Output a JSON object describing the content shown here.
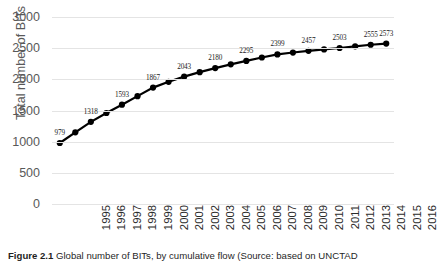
{
  "figure": {
    "caption_bold": "Figure 2.1",
    "caption_rest": " Global number of BITs, by cumulative flow (Source: based on UNCTAD"
  },
  "chart_data": {
    "type": "line",
    "title": "",
    "xlabel": "",
    "ylabel": "Total number of BITs",
    "ylim": [
      0,
      3000
    ],
    "yticks": [
      "0",
      "500",
      "1000",
      "1500",
      "2000",
      "2500",
      "3000"
    ],
    "ytick_values": [
      0,
      500,
      1000,
      1500,
      2000,
      2500,
      3000
    ],
    "grid": "horizontal",
    "legend": "none",
    "marker": "circle-filled-black",
    "line_color": "#000000",
    "categories": [
      "1995",
      "1996",
      "1997",
      "1998",
      "1999",
      "2000",
      "2001",
      "2002",
      "2003",
      "2004",
      "2005",
      "2006",
      "2007",
      "2008",
      "2009",
      "2010",
      "2011",
      "2012",
      "2013",
      "2014",
      "2015",
      "2016"
    ],
    "values": [
      979,
      1150,
      1318,
      1460,
      1593,
      1730,
      1867,
      1960,
      2043,
      2115,
      2180,
      2240,
      2295,
      2350,
      2399,
      2430,
      2457,
      2480,
      2503,
      2530,
      2555,
      2573
    ],
    "point_labels": [
      {
        "category": "1995",
        "value": 979,
        "text": "979"
      },
      {
        "category": "1997",
        "value": 1318,
        "text": "1318"
      },
      {
        "category": "1999",
        "value": 1593,
        "text": "1593"
      },
      {
        "category": "2001",
        "value": 1867,
        "text": "1867"
      },
      {
        "category": "2003",
        "value": 2043,
        "text": "2043"
      },
      {
        "category": "2005",
        "value": 2180,
        "text": "2180"
      },
      {
        "category": "2007",
        "value": 2295,
        "text": "2295"
      },
      {
        "category": "2009",
        "value": 2399,
        "text": "2399"
      },
      {
        "category": "2011",
        "value": 2457,
        "text": "2457"
      },
      {
        "category": "2013",
        "value": 2503,
        "text": "2503"
      },
      {
        "category": "2015",
        "value": 2555,
        "text": "2555"
      },
      {
        "category": "2016",
        "value": 2573,
        "text": "2573"
      }
    ]
  }
}
